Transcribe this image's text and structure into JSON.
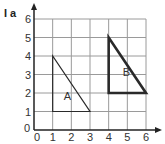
{
  "label": "I a",
  "grid": {
    "xmin": 0,
    "xmax": 6,
    "ymin": 0,
    "ymax": 6
  },
  "x_ticks": [
    "0",
    "1",
    "2",
    "3",
    "4",
    "5",
    "6"
  ],
  "y_ticks": [
    "0",
    "1",
    "2",
    "3",
    "4",
    "5",
    "6"
  ],
  "shapes": [
    {
      "name": "A",
      "vertices": [
        [
          1,
          4
        ],
        [
          1,
          1
        ],
        [
          3,
          1
        ]
      ],
      "label_at": [
        1.6,
        1.6
      ],
      "style": "thin"
    },
    {
      "name": "B",
      "vertices": [
        [
          4,
          5
        ],
        [
          4,
          2
        ],
        [
          6,
          2
        ]
      ],
      "label_at": [
        4.75,
        2.9
      ],
      "style": "thick"
    }
  ],
  "colors": {
    "grid": "#9a9a9a",
    "axis": "#222222",
    "shape": "#2a2a2a"
  }
}
